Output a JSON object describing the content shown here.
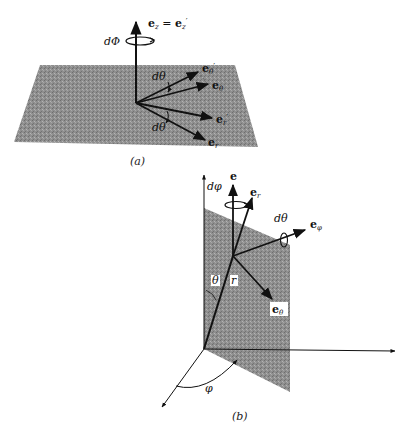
{
  "figure": {
    "panel_a": {
      "caption": "(a)",
      "labels": {
        "ez": "e",
        "ez_sub": "z",
        "eq": " = ",
        "ezp": "e",
        "ezp_sub": "z",
        "prime": "′",
        "dPhi": "dΦ",
        "etheta_p": "e",
        "etheta_p_sub": "θ",
        "etheta": "e",
        "etheta_sub": "θ",
        "er_p": "e",
        "er_p_sub": "r",
        "er": "e",
        "er_sub": "r",
        "dtheta_top": "dθ",
        "dtheta_bottom": "dθ"
      }
    },
    "panel_b": {
      "caption": "(b)",
      "labels": {
        "dphi": "dφ",
        "e": "e",
        "er": "e",
        "er_sub": "r",
        "dtheta": "dθ",
        "ephi": "e",
        "ephi_sub": "φ",
        "theta": "θ",
        "r": "r",
        "etheta": "e",
        "etheta_sub": "θ",
        "phi": "φ"
      }
    },
    "colors": {
      "ink": "#111111",
      "plane": "#8a8a8a"
    }
  }
}
